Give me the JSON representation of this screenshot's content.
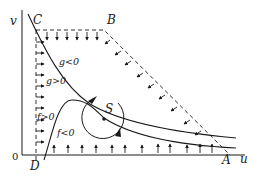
{
  "diagram": {
    "axes": {
      "x_label": "u",
      "y_label": "v",
      "origin_label": "0"
    },
    "vertices": {
      "A": "A",
      "B": "B",
      "C": "C",
      "D": "D"
    },
    "equilibrium_label": "S",
    "nullcline_labels": {
      "g_neg": "g<0",
      "g_pos": "g>0",
      "f_pos": "f>0",
      "f_neg": "f<0"
    },
    "colors": {
      "ink": "#1a1a1a",
      "background": "#ffffff"
    }
  }
}
